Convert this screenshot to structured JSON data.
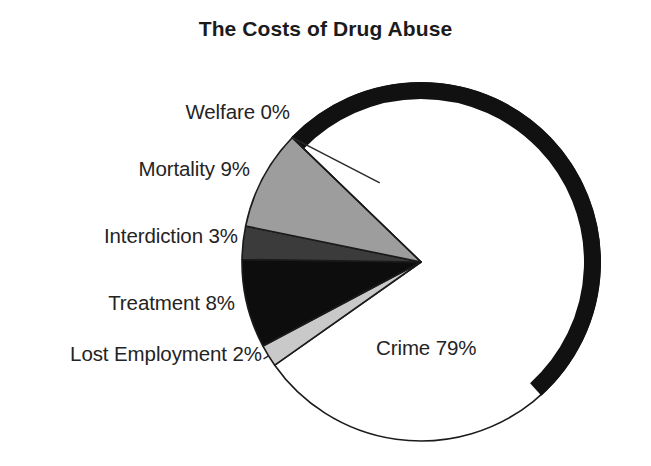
{
  "chart_data": {
    "type": "pie",
    "title": "The Costs of Drug Abuse",
    "xlabel": "",
    "ylabel": "",
    "legend_position": "none",
    "grid": false,
    "labels_show_percent": true,
    "categories": [
      "Welfare",
      "Mortality",
      "Interdiction",
      "Treatment",
      "Lost Employment",
      "Crime"
    ],
    "values": [
      0,
      9,
      3,
      8,
      2,
      79
    ],
    "unit": "%",
    "slices": [
      {
        "name": "Welfare",
        "value": 0,
        "label": "Welfare 0%",
        "fill": "#ffffff",
        "stroke": "#1b1b1b",
        "start_angle_deg": 136.0,
        "end_angle_deg": 136.0
      },
      {
        "name": "Mortality",
        "value": 9,
        "label": "Mortality 9%",
        "fill": "#9d9d9d",
        "stroke": "#1b1b1b",
        "start_angle_deg": 136.0,
        "end_angle_deg": 168.4
      },
      {
        "name": "Interdiction",
        "value": 3,
        "label": "Interdiction 3%",
        "fill": "#3b3b3b",
        "stroke": "#1b1b1b",
        "start_angle_deg": 168.4,
        "end_angle_deg": 179.2
      },
      {
        "name": "Treatment",
        "value": 8,
        "label": "Treatment 8%",
        "fill": "#0d0d0d",
        "stroke": "#1b1b1b",
        "start_angle_deg": 179.2,
        "end_angle_deg": 208.0
      },
      {
        "name": "Lost Employment",
        "value": 2,
        "label": "Lost Employment 2%",
        "fill": "#c9c9c9",
        "stroke": "#1b1b1b",
        "start_angle_deg": 208.0,
        "end_angle_deg": 215.2
      },
      {
        "name": "Crime",
        "value": 79,
        "label": "Crime 79%",
        "fill": "#ffffff",
        "stroke": "#1b1b1b",
        "start_angle_deg": 215.2,
        "end_angle_deg": 496.0
      }
    ],
    "colors": {
      "welfare": "#ffffff",
      "mortality": "#9d9d9d",
      "interdiction": "#3b3b3b",
      "treatment": "#0d0d0d",
      "lost_employment": "#c9c9c9",
      "crime": "#ffffff",
      "outline": "#1b1b1b",
      "background": "#ffffff",
      "text": "#242424"
    },
    "geometry": {
      "center_x": 421,
      "center_y": 262,
      "radius": 179,
      "shadow_arc_thickness": 17,
      "shadow_arc_start_deg": 312,
      "shadow_arc_end_deg": 496
    }
  }
}
